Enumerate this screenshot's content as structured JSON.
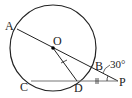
{
  "diagram": {
    "type": "geometry",
    "labels": {
      "A": "A",
      "O": "O",
      "B": "B",
      "C": "C",
      "D": "D",
      "P": "P"
    },
    "angle_label": "30°",
    "circle": {
      "center": "O",
      "cx": 53,
      "cy": 48,
      "r": 43
    },
    "points": {
      "A": [
        17,
        29
      ],
      "O": [
        53,
        48
      ],
      "B": [
        91,
        68
      ],
      "C": [
        23,
        81
      ],
      "D": [
        77,
        81
      ],
      "P": [
        118,
        81
      ]
    },
    "segments": [
      "A-P",
      "C-P",
      "O-D"
    ],
    "tick_marks": [
      "O-D",
      "D-P"
    ],
    "colors": {
      "stroke": "#222222",
      "chord": "#777777"
    }
  }
}
